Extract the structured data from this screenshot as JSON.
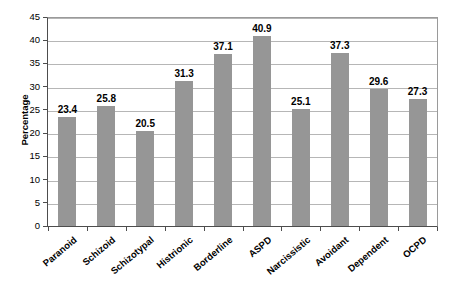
{
  "chart_data": {
    "type": "bar",
    "title": "",
    "xlabel": "",
    "ylabel": "Percentage",
    "ylim": [
      0,
      45
    ],
    "ytick_step": 5,
    "yticks": [
      45,
      40,
      35,
      30,
      25,
      20,
      15,
      10,
      5,
      0
    ],
    "grid": true,
    "legend": null,
    "bar_color": "#969696",
    "categories": [
      "Paranoid",
      "Schizoid",
      "Schizotypal",
      "Histrionic",
      "Borderline",
      "ASPD",
      "Narcissistic",
      "Avoidant",
      "Dependent",
      "OCPD"
    ],
    "values": [
      23.4,
      25.8,
      20.5,
      31.3,
      37.1,
      40.9,
      25.1,
      37.3,
      29.6,
      27.3
    ],
    "value_labels": [
      "23.4",
      "25.8",
      "20.5",
      "31.3",
      "37.1",
      "40.9",
      "25.1",
      "37.3",
      "29.6",
      "27.3"
    ]
  },
  "colors": {
    "bar": "#969696",
    "gridline": "#b6b6b6",
    "axis": "#4d4d4d",
    "frame": "#9a9a9a",
    "text": "#000000",
    "background": "#ffffff"
  }
}
